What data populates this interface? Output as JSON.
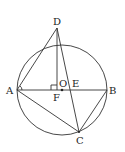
{
  "diagram": {
    "type": "geometry",
    "circle": {
      "center": "O",
      "cx": 62,
      "cy": 90,
      "r": 45
    },
    "points": {
      "A": {
        "label": "A",
        "x": 17,
        "y": 90
      },
      "B": {
        "label": "B",
        "x": 107,
        "y": 90
      },
      "C": {
        "label": "C",
        "x": 79,
        "y": 132
      },
      "D": {
        "label": "D",
        "x": 57,
        "y": 28
      },
      "O": {
        "label": "O",
        "x": 62,
        "y": 90
      },
      "E": {
        "label": "E",
        "x": 70,
        "y": 90
      },
      "F": {
        "label": "F",
        "x": 57,
        "y": 90
      }
    },
    "segments": [
      "AB",
      "AD",
      "DF",
      "DC",
      "AC",
      "BC"
    ],
    "right_angle_at": "F",
    "angle_mark_at": "A"
  }
}
